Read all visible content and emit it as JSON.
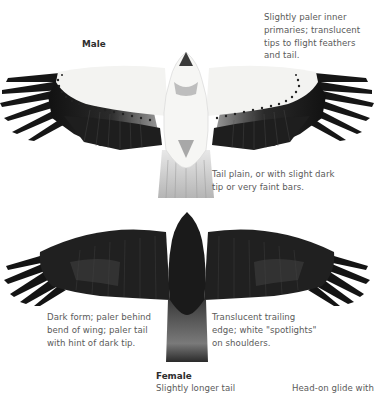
{
  "male": {
    "title": "Male",
    "note_wing": [
      "Slightly paler inner",
      "primaries; translucent",
      "tips to flight feathers",
      "and tail."
    ],
    "note_tail": [
      "Tail plain, or with slight dark",
      "tip or very faint bars."
    ]
  },
  "female": {
    "title": "Female",
    "note_left": [
      "Dark form; paler behind",
      "bend of wing; paler tail",
      "with hint of dark tip."
    ],
    "note_right": [
      "Translucent trailing",
      "edge; white \"spotlights\"",
      "on shoulders."
    ],
    "caption": "Slightly longer tail"
  },
  "other": {
    "caption": "Head-on glide with"
  },
  "illustrations": [
    {
      "name": "male-bird-underside",
      "colors": {
        "body": "#f4f4f2",
        "primaries": "#1a1a1a",
        "secondaries": "#262626"
      }
    },
    {
      "name": "female-bird-underside",
      "colors": {
        "body": "#1c1c1c",
        "wing": "#222222",
        "tail": "#6e6e6e"
      }
    }
  ]
}
